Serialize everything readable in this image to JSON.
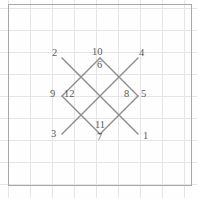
{
  "figure": {
    "canvas": {
      "width": 197,
      "height": 198
    },
    "colors": {
      "background": "#fefefe",
      "grid_minor": "#f0eeee",
      "grid_major": "#e6e4e4",
      "border": "#a9a7a7",
      "stroke": "#8e8c8c",
      "label_text": "#5b5b5b"
    },
    "grid": {
      "visible": true,
      "spacing_px": 22,
      "origin_x": 8,
      "origin_y": 8,
      "columns": 9,
      "rows": 8,
      "paper_border": {
        "x": 8,
        "y": 4,
        "width": 183,
        "height": 181
      }
    },
    "segments": [
      {
        "name": "segment-2-1",
        "x1": 62,
        "y1": 58,
        "x2": 138,
        "y2": 134
      },
      {
        "name": "segment-4-3",
        "x1": 138,
        "y1": 58,
        "x2": 62,
        "y2": 134
      },
      {
        "name": "segment-10-7",
        "x1": 100,
        "y1": 58,
        "x2": 100,
        "y2": 134,
        "render": "none"
      },
      {
        "name": "edge-10-12",
        "x1": 100,
        "y1": 58,
        "x2": 62,
        "y2": 96
      },
      {
        "name": "edge-10-8",
        "x1": 100,
        "y1": 58,
        "x2": 138,
        "y2": 96
      },
      {
        "name": "edge-12-7",
        "x1": 62,
        "y1": 96,
        "x2": 100,
        "y2": 134
      },
      {
        "name": "edge-8-7",
        "x1": 138,
        "y1": 96,
        "x2": 100,
        "y2": 134
      }
    ],
    "points": [
      {
        "id": 1,
        "label": "1",
        "x": 143,
        "y": 130,
        "name": "point-label-1",
        "align": "left"
      },
      {
        "id": 2,
        "label": "2",
        "x": 52,
        "y": 47,
        "name": "point-label-2",
        "align": "left"
      },
      {
        "id": 3,
        "label": "3",
        "x": 51,
        "y": 128,
        "name": "point-label-3",
        "align": "left"
      },
      {
        "id": 4,
        "label": "4",
        "x": 139,
        "y": 47,
        "name": "point-label-4",
        "align": "left"
      },
      {
        "id": 5,
        "label": "5",
        "x": 141,
        "y": 88,
        "name": "point-label-5",
        "align": "left"
      },
      {
        "id": 6,
        "label": "6",
        "x": 97,
        "y": 59,
        "name": "point-label-6",
        "align": "left"
      },
      {
        "id": 7,
        "label": "7",
        "x": 97,
        "y": 131,
        "name": "point-label-7",
        "align": "left"
      },
      {
        "id": 8,
        "label": "8",
        "x": 124,
        "y": 88,
        "name": "point-label-8",
        "align": "left"
      },
      {
        "id": 9,
        "label": "9",
        "x": 50,
        "y": 88,
        "name": "point-label-9",
        "align": "left"
      },
      {
        "id": 10,
        "label": "10",
        "x": 92,
        "y": 46,
        "name": "point-label-10",
        "align": "left"
      },
      {
        "id": 11,
        "label": "11",
        "x": 95,
        "y": 119,
        "name": "point-label-11",
        "align": "left"
      },
      {
        "id": 12,
        "label": "12",
        "x": 64,
        "y": 88,
        "name": "point-label-12",
        "align": "left"
      }
    ]
  }
}
